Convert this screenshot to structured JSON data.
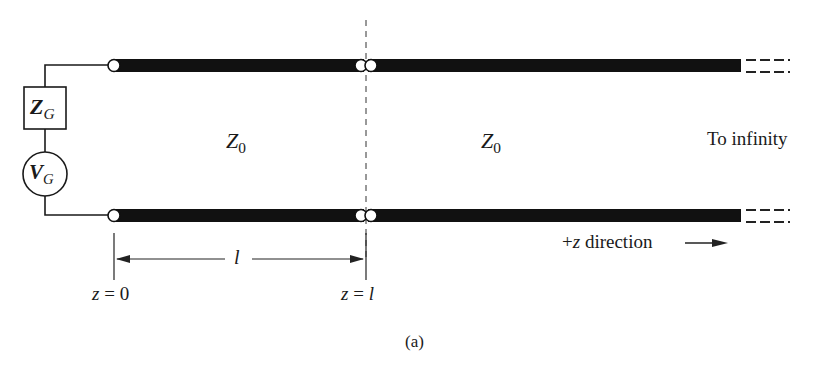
{
  "figure": {
    "caption": "(a)",
    "generator": {
      "impedance": {
        "symbol": "Z",
        "subscript": "G"
      },
      "voltage": {
        "symbol": "V",
        "subscript": "G"
      }
    },
    "sections": [
      {
        "impedance_symbol": "Z",
        "impedance_subscript": "0"
      },
      {
        "impedance_symbol": "Z",
        "impedance_subscript": "0"
      }
    ],
    "right_label": "To infinity",
    "length_label": "l",
    "positions": [
      {
        "left": "z",
        "eq": "=",
        "right": "0"
      },
      {
        "left": "z",
        "eq": "=",
        "right": "l"
      }
    ],
    "direction": {
      "prefix": "+",
      "var": "z",
      "text": "direction"
    }
  },
  "colors": {
    "line": "#111111",
    "background": "#ffffff"
  }
}
